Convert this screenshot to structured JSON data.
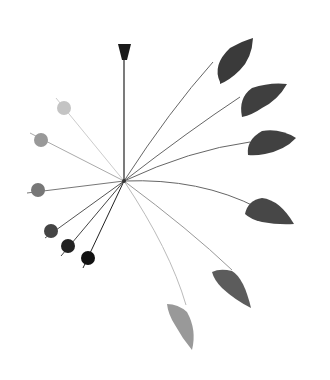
{
  "image": {
    "subject": "hanging mobile sculpture",
    "background": "#ffffff",
    "hub": {
      "x": 124,
      "y": 181
    },
    "cap": {
      "color": "#1a1a1a"
    },
    "rods": {
      "color": "#555555"
    },
    "balls": [
      {
        "x": 64,
        "y": 108,
        "r": 7,
        "color": "#c4c4c4"
      },
      {
        "x": 41,
        "y": 140,
        "r": 7,
        "color": "#999999"
      },
      {
        "x": 38,
        "y": 190,
        "r": 7,
        "color": "#777777"
      },
      {
        "x": 51,
        "y": 231,
        "r": 7,
        "color": "#444444"
      },
      {
        "x": 68,
        "y": 246,
        "r": 7,
        "color": "#222222"
      },
      {
        "x": 88,
        "y": 258,
        "r": 7,
        "color": "#111111"
      }
    ],
    "leaves": [
      {
        "tip": [
          213,
          62
        ],
        "color": "#3a3a3a"
      },
      {
        "tip": [
          240,
          97
        ],
        "color": "#3f3f3f"
      },
      {
        "tip": [
          250,
          142
        ],
        "color": "#414141"
      },
      {
        "tip": [
          245,
          210
        ],
        "color": "#474747"
      },
      {
        "tip": [
          212,
          275
        ],
        "color": "#5c5c5c"
      },
      {
        "tip": [
          167,
          305
        ],
        "color": "#999999"
      }
    ]
  }
}
